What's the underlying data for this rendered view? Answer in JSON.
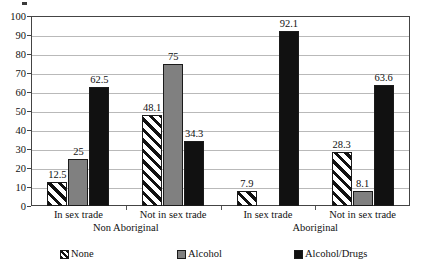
{
  "chart_data": {
    "type": "bar",
    "title": "",
    "xlabel": "",
    "ylabel": "",
    "ylim": [
      0,
      100
    ],
    "ytick_step": 10,
    "ytick_labels": [
      "100",
      "90",
      "80",
      "70",
      "60",
      "50",
      "40",
      "30",
      "20",
      "10",
      "0"
    ],
    "grid": true,
    "legend_position": "bottom",
    "categories": [
      "In sex trade",
      "Not in sex trade",
      "In sex trade",
      "Not in sex trade"
    ],
    "supercategories": [
      {
        "label": "Non Aboriginal",
        "spans": [
          0,
          1
        ]
      },
      {
        "label": "Aboriginal",
        "spans": [
          2,
          3
        ]
      }
    ],
    "series": [
      {
        "name": "None",
        "pattern": "diagonal-hatch",
        "color": "#ffffff",
        "values": [
          12.5,
          48.1,
          7.9,
          28.3
        ]
      },
      {
        "name": "Alcohol",
        "pattern": "solid",
        "color": "#808080",
        "values": [
          25,
          75,
          0,
          8.1
        ]
      },
      {
        "name": "Alcohol/Drugs",
        "pattern": "solid",
        "color": "#111111",
        "values": [
          62.5,
          34.3,
          92.1,
          63.6
        ]
      }
    ],
    "value_labels": [
      [
        "12.5",
        "48.1",
        "7.9",
        "28.3"
      ],
      [
        "25",
        "75",
        "",
        "8.1"
      ],
      [
        "62.5",
        "34.3",
        "92.1",
        "63.6"
      ]
    ]
  },
  "legend": {
    "items": [
      {
        "label": "None"
      },
      {
        "label": "Alcohol"
      },
      {
        "label": "Alcohol/Drugs"
      }
    ]
  }
}
